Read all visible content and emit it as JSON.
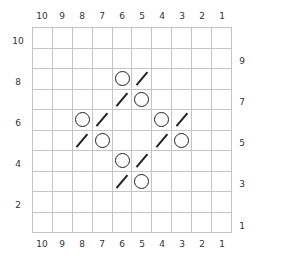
{
  "chart": {
    "columns_top": [
      "10",
      "9",
      "8",
      "7",
      "6",
      "5",
      "4",
      "3",
      "2",
      "1"
    ],
    "columns_bottom": [
      "10",
      "9",
      "8",
      "7",
      "6",
      "5",
      "4",
      "3",
      "2",
      "1"
    ],
    "rows_left": [
      "10",
      "8",
      "6",
      "4",
      "2"
    ],
    "rows_right": [
      "9",
      "7",
      "5",
      "3",
      "1"
    ],
    "symbols": {
      "yo": "circle (yarn over)",
      "k2tog": "right-leaning slash (k2tog)"
    },
    "cells": [
      {
        "row": 8,
        "col": 6,
        "symbol": "yo"
      },
      {
        "row": 8,
        "col": 5,
        "symbol": "k2tog"
      },
      {
        "row": 7,
        "col": 6,
        "symbol": "k2tog"
      },
      {
        "row": 7,
        "col": 5,
        "symbol": "yo"
      },
      {
        "row": 6,
        "col": 8,
        "symbol": "yo"
      },
      {
        "row": 6,
        "col": 7,
        "symbol": "k2tog"
      },
      {
        "row": 6,
        "col": 4,
        "symbol": "yo"
      },
      {
        "row": 6,
        "col": 3,
        "symbol": "k2tog"
      },
      {
        "row": 5,
        "col": 8,
        "symbol": "k2tog"
      },
      {
        "row": 5,
        "col": 7,
        "symbol": "yo"
      },
      {
        "row": 5,
        "col": 4,
        "symbol": "k2tog"
      },
      {
        "row": 5,
        "col": 3,
        "symbol": "yo"
      },
      {
        "row": 4,
        "col": 6,
        "symbol": "yo"
      },
      {
        "row": 4,
        "col": 5,
        "symbol": "k2tog"
      },
      {
        "row": 3,
        "col": 6,
        "symbol": "k2tog"
      },
      {
        "row": 3,
        "col": 5,
        "symbol": "yo"
      }
    ]
  }
}
